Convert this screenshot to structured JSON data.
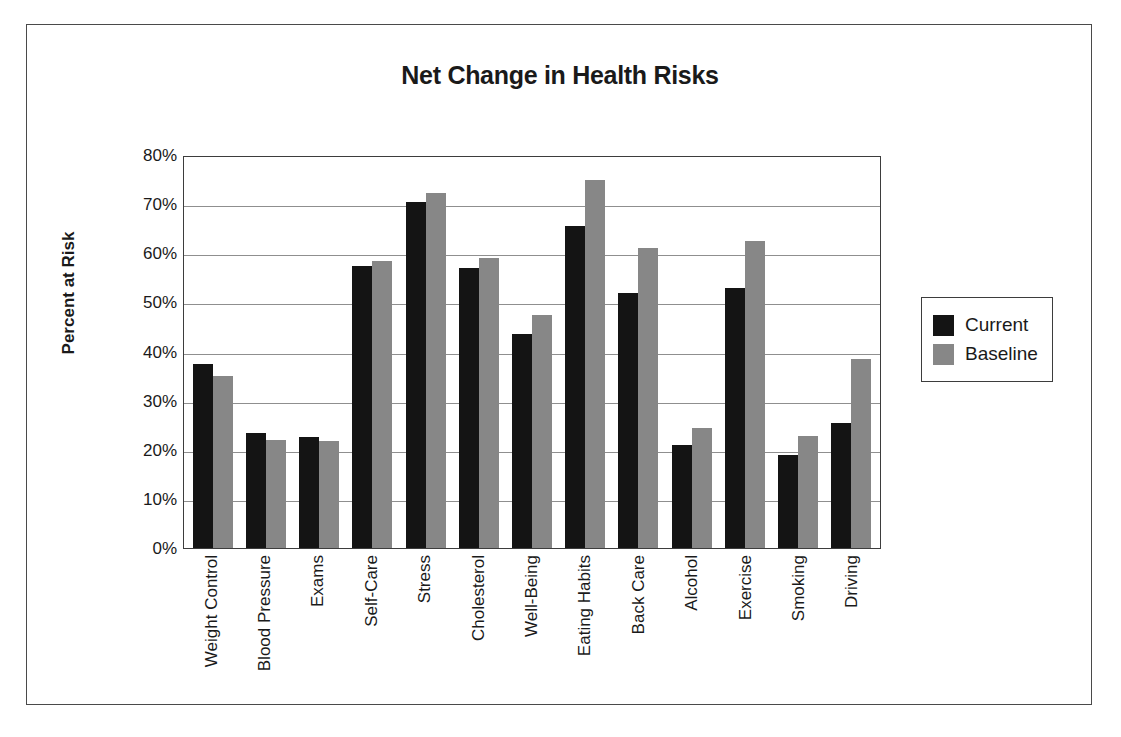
{
  "chart_data": {
    "type": "bar",
    "title": "Net Change in Health Risks",
    "xlabel": "",
    "ylabel": "Percent at Risk",
    "ylim": [
      0,
      80
    ],
    "ytick_labels": [
      "80%",
      "70%",
      "60%",
      "50%",
      "40%",
      "30%",
      "20%",
      "10%",
      "0%"
    ],
    "ytick_values": [
      80,
      70,
      60,
      50,
      40,
      30,
      20,
      10,
      0
    ],
    "grid": true,
    "legend_position": "right",
    "categories": [
      "Weight Control",
      "Blood Pressure",
      "Exams",
      "Self-Care",
      "Stress",
      "Cholesterol",
      "Well-Being",
      "Eating Habits",
      "Back Care",
      "Alcohol",
      "Exercise",
      "Smoking",
      "Driving"
    ],
    "series": [
      {
        "name": "Current",
        "color": "#141414",
        "values": [
          37.5,
          23.5,
          22.5,
          57.5,
          70.5,
          57,
          43.5,
          65.5,
          52,
          21,
          53,
          19,
          25.5
        ]
      },
      {
        "name": "Baseline",
        "color": "#878787",
        "values": [
          35,
          22,
          21.8,
          58.5,
          72.3,
          59,
          47.5,
          75,
          61,
          24.5,
          62.5,
          22.8,
          38.5
        ]
      }
    ]
  },
  "legend": {
    "items": [
      {
        "label": "Current",
        "swatch": "current"
      },
      {
        "label": "Baseline",
        "swatch": "baseline"
      }
    ]
  }
}
